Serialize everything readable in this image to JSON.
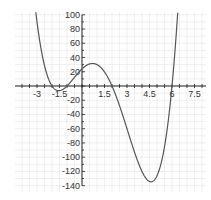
{
  "chart_data": {
    "type": "line",
    "title": "",
    "xlabel": "",
    "ylabel": "",
    "function": "f(x) = (x+2)(x+1)(x-2)(x-6)",
    "xlim": [
      -4.3,
      8.3
    ],
    "ylim": [
      -148,
      104
    ],
    "grid": true,
    "x_ticks": [
      -3,
      -1.5,
      1.5,
      3,
      4.5,
      6,
      7.5
    ],
    "x_tick_labels": [
      "-3",
      "-1.5",
      "1.5",
      "3",
      "4.5",
      "6",
      "7.5"
    ],
    "y_ticks": [
      100,
      80,
      60,
      40,
      20,
      -20,
      -40,
      -60,
      -80,
      -100,
      -120,
      -140
    ],
    "y_tick_labels": [
      "100",
      "80",
      "60",
      "40",
      "20",
      "-20",
      "-40",
      "-60",
      "-80",
      "-100",
      "-120",
      "-140"
    ],
    "series": [
      {
        "name": "f(x)",
        "color": "#555555",
        "x": [
          -3,
          -2.5,
          -2,
          -1.5,
          -1,
          -0.5,
          0,
          0.5,
          1,
          1.5,
          2,
          2.5,
          3,
          3.5,
          4,
          4.5,
          5,
          5.5,
          6,
          6.3
        ],
        "values": [
          72,
          23.6,
          0,
          -6.6,
          0,
          12.3,
          24,
          31.2,
          30,
          18.4,
          0,
          -23.6,
          -45,
          -65.3,
          -72,
          -134,
          -105,
          -90.8,
          0,
          75
        ]
      }
    ],
    "key_points": {
      "roots": [
        -2,
        -1,
        2,
        6
      ],
      "local_max": [
        1,
        30
      ],
      "local_min": [
        4.5,
        -134
      ]
    }
  },
  "colors": {
    "grid": "#e4e4e4",
    "axis": "#222222",
    "curve": "#555555"
  }
}
